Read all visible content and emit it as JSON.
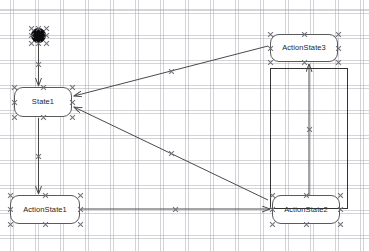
{
  "diagram": {
    "canvas": {
      "width": 369,
      "height": 251,
      "background": "#ffffff"
    },
    "grid": {
      "spacing": 25,
      "color": "#969aa0",
      "style": "dotted"
    },
    "colors": {
      "node_stroke": "#5a5a5a",
      "node_fill": "#ffffff",
      "edge": "#4a4a4a",
      "start_node": "#0b0b0b",
      "group_stroke": "#333333",
      "handle": "#707078",
      "label": "#1d1d1d"
    },
    "nodes": [
      {
        "id": "start",
        "type": "initial-state",
        "label": "",
        "x": 31,
        "y": 28,
        "w": 15,
        "h": 15
      },
      {
        "id": "state1",
        "type": "state",
        "label": "State1",
        "x": 14,
        "y": 87,
        "w": 58,
        "h": 30
      },
      {
        "id": "actionstate1",
        "type": "action-state",
        "label": "ActionState1",
        "x": 10,
        "y": 195,
        "w": 70,
        "h": 29
      },
      {
        "id": "actionstate2",
        "type": "action-state",
        "label": "ActionState2",
        "x": 272,
        "y": 195,
        "w": 68,
        "h": 29
      },
      {
        "id": "actionstate3",
        "type": "action-state",
        "label": "ActionState3",
        "x": 270,
        "y": 34,
        "w": 68,
        "h": 28
      }
    ],
    "group": {
      "id": "group-rect",
      "label": "",
      "x": 270,
      "y": 68,
      "w": 78,
      "h": 141
    },
    "edges": [
      {
        "id": "e1",
        "from": "start",
        "to": "state1",
        "x1": 38.5,
        "y1": 43,
        "x2": 38.5,
        "y2": 86
      },
      {
        "id": "e2",
        "from": "state1",
        "to": "actionstate1",
        "x1": 38.5,
        "y1": 118,
        "x2": 38.5,
        "y2": 194
      },
      {
        "id": "e3",
        "from": "actionstate1",
        "to": "actionstate2",
        "x1": 81,
        "y1": 209,
        "x2": 270,
        "y2": 209
      },
      {
        "id": "e4",
        "from": "actionstate3",
        "to": "state1",
        "x1": 268,
        "y1": 46,
        "x2": 74,
        "y2": 96
      },
      {
        "id": "e5",
        "from": "actionstate2",
        "to": "state1",
        "x1": 268,
        "y1": 200,
        "x2": 74,
        "y2": 107
      },
      {
        "id": "e6",
        "from": "actionstate2",
        "to": "actionstate3",
        "x1": 309,
        "y1": 195,
        "x2": 309,
        "y2": 64
      }
    ],
    "selection": {
      "active": true,
      "handle_glyph": "x-handle"
    }
  }
}
